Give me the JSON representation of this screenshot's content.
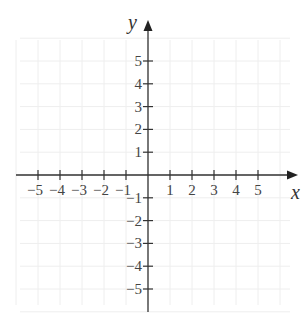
{
  "chart_data": {
    "type": "coordinate-plane",
    "title": "",
    "xlabel": "x",
    "ylabel": "y",
    "xlim": [
      -5,
      5
    ],
    "ylim": [
      -5,
      5
    ],
    "grid": true,
    "x_ticks": [
      -5,
      -4,
      -3,
      -2,
      -1,
      1,
      2,
      3,
      4,
      5
    ],
    "y_ticks": [
      -5,
      -4,
      -3,
      -2,
      -1,
      1,
      2,
      3,
      4,
      5
    ],
    "x_tick_labels": [
      "−5",
      "−4",
      "−3",
      "−2",
      "−1",
      "1",
      "2",
      "3",
      "4",
      "5"
    ],
    "y_tick_labels": [
      "−5",
      "−4",
      "−3",
      "−2",
      "−1",
      "1",
      "2",
      "3",
      "4",
      "5"
    ]
  },
  "colors": {
    "axis": "#333333",
    "grid": "#eeeeee",
    "label": "#444444"
  },
  "axes": {
    "x_label": "x",
    "y_label": "y"
  }
}
